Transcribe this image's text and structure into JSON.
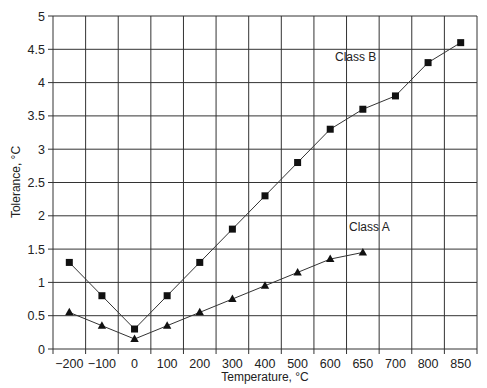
{
  "chart_data": {
    "type": "line",
    "title": "",
    "xlabel": "Temperature, °C",
    "ylabel": "Tolerance, °C",
    "categories": [
      "-200",
      "-100",
      "0",
      "100",
      "200",
      "300",
      "400",
      "500",
      "600",
      "650",
      "700",
      "800",
      "850"
    ],
    "x_tick_labels": [
      "−200",
      "−100",
      "0",
      "100",
      "200",
      "300",
      "400",
      "500",
      "600",
      "650",
      "700",
      "800",
      "850"
    ],
    "y_ticks": [
      0,
      0.5,
      1,
      1.5,
      2,
      2.5,
      3,
      3.5,
      4,
      4.5,
      5
    ],
    "ylim": [
      0,
      5
    ],
    "grid": true,
    "legend_position": "inline-labels",
    "series": [
      {
        "name": "Class B",
        "marker": "square",
        "values": [
          1.3,
          0.8,
          0.3,
          0.8,
          1.3,
          1.8,
          2.3,
          2.8,
          3.3,
          3.6,
          3.8,
          4.3,
          4.6
        ],
        "label_anchor": {
          "x": 335,
          "y": 61
        }
      },
      {
        "name": "Class A",
        "marker": "triangle",
        "values": [
          0.55,
          0.35,
          0.15,
          0.35,
          0.55,
          0.75,
          0.95,
          1.15,
          1.35,
          1.45,
          null,
          null,
          null
        ],
        "label_anchor": {
          "x": 349,
          "y": 231
        }
      }
    ],
    "colors": {
      "line": "#333333",
      "marker": "#111111",
      "grid": "#333333",
      "background": "#ffffff"
    }
  }
}
